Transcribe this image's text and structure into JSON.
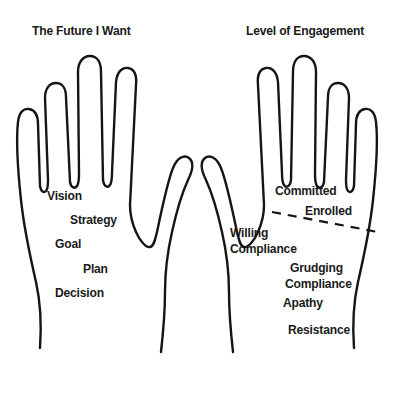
{
  "canvas": {
    "width": 394,
    "height": 413,
    "background": "#ffffff",
    "ink": "#151515"
  },
  "panels": [
    {
      "id": "future",
      "title": "The Future I Want",
      "title_pos": {
        "x": 32,
        "y": 23
      },
      "hand": "left-hand-outline",
      "labels": [
        {
          "text": "Vision",
          "x": 47,
          "y": 188
        },
        {
          "text": "Strategy",
          "x": 70,
          "y": 212
        },
        {
          "text": "Goal",
          "x": 55,
          "y": 236
        },
        {
          "text": "Plan",
          "x": 83,
          "y": 261
        },
        {
          "text": "Decision",
          "x": 55,
          "y": 285
        }
      ]
    },
    {
      "id": "engagement",
      "title": "Level of Engagement",
      "title_pos": {
        "x": 246,
        "y": 23
      },
      "hand": "right-hand-outline",
      "labels": [
        {
          "text": "Committed",
          "x": 275,
          "y": 183
        },
        {
          "text": "Enrolled",
          "x": 305,
          "y": 203
        },
        {
          "text": "Willing",
          "x": 230,
          "y": 225
        },
        {
          "text": "Compliance",
          "x": 230,
          "y": 241
        },
        {
          "text": "Grudging",
          "x": 290,
          "y": 260
        },
        {
          "text": "Compliance",
          "x": 285,
          "y": 276
        },
        {
          "text": "Apathy",
          "x": 283,
          "y": 295
        },
        {
          "text": "Resistance",
          "x": 288,
          "y": 322
        }
      ],
      "divider": {
        "name": "dashed-divider",
        "x1": 272,
        "y1": 212,
        "x2": 378,
        "y2": 232
      }
    }
  ],
  "shapes": {
    "left_hand": "M 40 348 C 42 320 40 300 36 282 C 30 256 24 228 21 200 C 18 172 16 140 18 122 C 19 112 24 108 29 109 C 35 110 38 116 38 124 L 40 186 C 41 192 44 193 46 191 C 48 189 48 184 48 180 L 45 98 C 45 88 50 83 56 83 C 62 83 66 88 66 97 L 70 182 C 71 188 75 189 77 186 C 79 183 79 178 79 174 L 78 72 C 78 62 83 56 90 56 C 97 56 101 62 101 72 L 103 180 C 104 187 108 188 110 185 C 112 182 112 177 112 173 L 116 82 C 117 72 122 67 128 68 C 134 69 137 75 136 85 L 130 205 C 130 216 132 223 136 232 C 140 241 146 248 150 247 C 154 246 155 240 157 232 C 162 208 168 180 173 168 C 177 158 184 154 189 158 C 194 162 193 170 188 180 C 182 193 176 214 172 232 C 167 254 165 272 165 292 C 165 314 163 334 161 352",
    "right_hand": "M 354 348 C 352 320 354 300 358 282 C 364 256 370 228 373 200 C 376 172 378 140 376 122 C 375 112 370 108 365 109 C 359 110 356 116 356 124 L 354 186 C 353 192 350 193 348 191 C 346 189 346 184 346 180 L 349 98 C 349 88 344 83 338 83 C 332 83 328 88 328 97 L 324 182 C 323 188 319 189 317 186 C 315 183 315 178 315 174 L 316 72 C 316 62 311 56 304 56 C 297 56 293 62 293 72 L 291 180 C 290 187 286 188 284 185 C 282 182 282 177 282 173 L 278 82 C 277 72 272 67 266 68 C 260 69 257 75 258 85 L 264 205 C 264 216 262 223 258 232 C 254 241 248 248 244 247 C 240 246 239 240 237 232 C 232 208 226 180 221 168 C 217 158 210 154 205 158 C 200 162 201 170 206 180 C 212 193 218 214 222 232 C 227 254 229 272 229 292 C 229 314 231 334 233 352"
  }
}
